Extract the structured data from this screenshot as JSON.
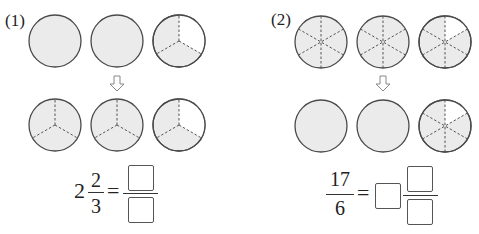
{
  "problems": [
    {
      "label": "(1)",
      "top_row": {
        "parts_per_circle": 1,
        "circles": [
          {
            "shaded_parts": 1,
            "total_parts": 1
          },
          {
            "shaded_parts": 1,
            "total_parts": 1
          },
          {
            "shaded_parts": 2,
            "total_parts": 3
          }
        ]
      },
      "arrow": "down-arrow",
      "bottom_row": {
        "circles": [
          {
            "shaded_parts": 3,
            "total_parts": 3
          },
          {
            "shaded_parts": 3,
            "total_parts": 3
          },
          {
            "shaded_parts": 2,
            "total_parts": 3
          }
        ]
      },
      "equation": {
        "whole": "2",
        "numerator": "2",
        "denominator": "3",
        "equals": "=",
        "answer_numerator": "",
        "answer_denominator": ""
      }
    },
    {
      "label": "(2)",
      "top_row": {
        "circles": [
          {
            "shaded_parts": 6,
            "total_parts": 6
          },
          {
            "shaded_parts": 6,
            "total_parts": 6
          },
          {
            "shaded_parts": 5,
            "total_parts": 6
          }
        ]
      },
      "arrow": "down-arrow",
      "bottom_row": {
        "circles": [
          {
            "shaded_parts": 1,
            "total_parts": 1
          },
          {
            "shaded_parts": 1,
            "total_parts": 1
          },
          {
            "shaded_parts": 5,
            "total_parts": 6
          }
        ]
      },
      "equation": {
        "numerator": "17",
        "denominator": "6",
        "equals": "=",
        "answer_whole": "",
        "answer_numerator": "",
        "answer_denominator": ""
      }
    }
  ],
  "colors": {
    "shade": "#ebebeb",
    "stroke": "#4a4a4a",
    "dash": "#555555"
  }
}
